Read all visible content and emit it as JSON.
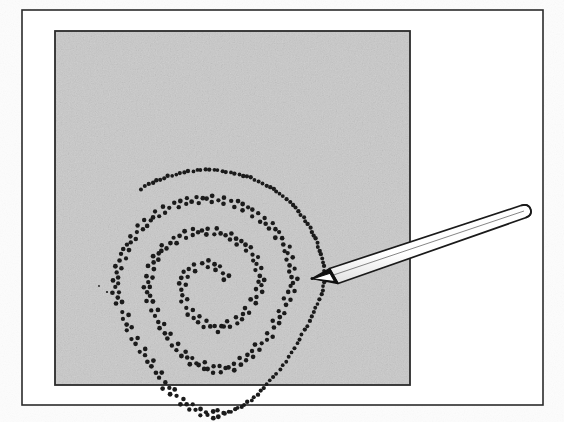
{
  "figure": {
    "kind": "line-illustration",
    "caption": "",
    "background_color": "#fefefe",
    "ink_color": "#1a1a1a"
  },
  "frame": {
    "name": "outer-frame",
    "x": 22,
    "y": 10,
    "width": 521,
    "height": 395,
    "stroke": "#2b2b2b",
    "stroke_width": 1.6,
    "fill": "#ffffff"
  },
  "panel": {
    "name": "shaded-panel",
    "x": 55,
    "y": 31,
    "width": 355,
    "height": 354,
    "fill": "#c9c9c9",
    "stroke": "#2b2b2b",
    "stroke_width": 1.8,
    "texture": "paper-noise"
  },
  "pencil": {
    "name": "pencil",
    "tip_x": 312,
    "tip_y": 278,
    "end_x": 528,
    "end_y": 210,
    "body_fill": "#ffffff",
    "outline": "#1a1a1a",
    "outline_width": 1.6,
    "shading": "#d6d6d6",
    "tip_label": "graphite-tip",
    "barrel_label": "pencil-barrel"
  },
  "chart_data": {
    "type": "scatter",
    "title": "",
    "xlabel": "",
    "ylabel": "",
    "grid": false,
    "legend": "none",
    "xlim": [
      55,
      410
    ],
    "ylim": [
      31,
      385
    ],
    "marker": "triangular-triad",
    "marker_color": "#1b1b1b",
    "marker_radius": 2.1,
    "series": [
      {
        "name": "spiral-trace",
        "note": "Spiral path of dot triads; single dots along the outer trailing arc near the pencil tip",
        "turns": 3.35,
        "center_x": 212,
        "center_y": 285,
        "values": []
      }
    ]
  }
}
